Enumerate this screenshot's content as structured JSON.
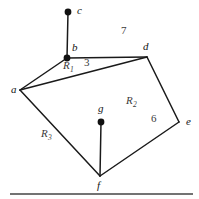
{
  "figure": {
    "type": "planar-graph-regions-diagram",
    "background_color": "#ffffff",
    "stroke_color": "#1a1a1a",
    "label_color": "#3a3a3a",
    "vertex_label_color": "#141414",
    "vertices": [
      {
        "id": "a",
        "label": "a",
        "x": 20,
        "y": 90,
        "dot": false,
        "label_x": 11,
        "label_y": 84
      },
      {
        "id": "b",
        "label": "b",
        "x": 67,
        "y": 58,
        "dot": true,
        "label_x": 72,
        "label_y": 42
      },
      {
        "id": "c",
        "label": "c",
        "x": 68,
        "y": 12,
        "dot": true,
        "label_x": 77,
        "label_y": 5
      },
      {
        "id": "d",
        "label": "d",
        "x": 147,
        "y": 57,
        "dot": false,
        "label_x": 143,
        "label_y": 41
      },
      {
        "id": "e",
        "label": "e",
        "x": 179,
        "y": 122,
        "dot": false,
        "label_x": 186,
        "label_y": 116
      },
      {
        "id": "f",
        "label": "f",
        "x": 100,
        "y": 176,
        "dot": false,
        "label_x": 97,
        "label_y": 180
      },
      {
        "id": "g",
        "label": "g",
        "x": 101,
        "y": 122,
        "dot": true,
        "label_x": 98,
        "label_y": 103
      }
    ],
    "edges": [
      {
        "id": "edge-bc",
        "from": "b",
        "to": "c"
      },
      {
        "id": "edge-ab",
        "from": "a",
        "to": "b"
      },
      {
        "id": "edge-bd",
        "from": "b",
        "to": "d"
      },
      {
        "id": "edge-ad",
        "from": "a",
        "to": "d"
      },
      {
        "id": "edge-de",
        "from": "d",
        "to": "e"
      },
      {
        "id": "edge-ef",
        "from": "e",
        "to": "f"
      },
      {
        "id": "edge-af",
        "from": "a",
        "to": "f"
      },
      {
        "id": "edge-fg",
        "from": "f",
        "to": "g"
      }
    ],
    "region_labels": [
      {
        "id": "R1",
        "letter": "R",
        "subscript": "1",
        "x": 63,
        "y": 60
      },
      {
        "id": "R2",
        "letter": "R",
        "subscript": "2",
        "x": 126,
        "y": 95
      },
      {
        "id": "R3",
        "letter": "R",
        "subscript": "3",
        "x": 41,
        "y": 128
      }
    ],
    "edge_labels": [
      {
        "id": "label-3",
        "text": "3",
        "x": 84,
        "y": 57
      },
      {
        "id": "label-7",
        "text": "7",
        "x": 121,
        "y": 25
      },
      {
        "id": "label-6",
        "text": "6",
        "x": 151,
        "y": 113
      }
    ],
    "baseline_rule": {
      "x1": 10,
      "y1": 194,
      "x2": 193,
      "y2": 194
    }
  }
}
